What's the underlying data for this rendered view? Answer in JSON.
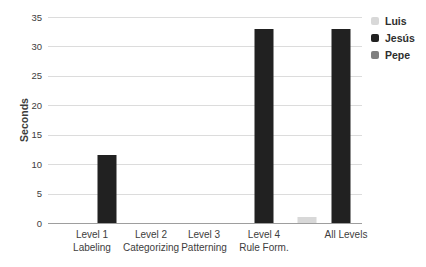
{
  "chart_data": {
    "type": "bar",
    "title": "",
    "xlabel": "",
    "ylabel": "Seconds",
    "ylim": [
      0,
      35
    ],
    "yticks": [
      0,
      5,
      10,
      15,
      20,
      25,
      30,
      35
    ],
    "grid": "horizontal",
    "legend_position": "top-right",
    "categories": [
      {
        "line1": "Level 1",
        "line2": "Labeling"
      },
      {
        "line1": "Level 2",
        "line2": "Categorizing"
      },
      {
        "line1": "Level 3",
        "line2": "Patterning"
      },
      {
        "line1": "Level 4",
        "line2": "Rule Form."
      },
      {
        "line1": "All Levels",
        "line2": ""
      }
    ],
    "series": [
      {
        "name": "Luis",
        "color": "#d8d8d8",
        "values": [
          0,
          0,
          0,
          0,
          1
        ]
      },
      {
        "name": "Jesús",
        "color": "#212121",
        "values": [
          11.6,
          0,
          0,
          33,
          33
        ]
      },
      {
        "name": "Pepe",
        "color": "#7f7f7f",
        "values": [
          0,
          0,
          0,
          0,
          0
        ]
      }
    ]
  },
  "colors": {
    "gridline": "#dcdcdc",
    "axis_line": "#9e9e9e",
    "text": "#3d3d3d",
    "background": "#ffffff"
  }
}
